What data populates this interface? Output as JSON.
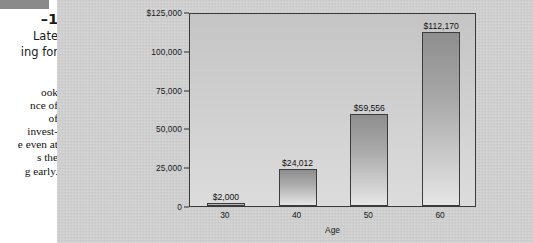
{
  "caption": {
    "rule": "",
    "figure_number": "–1",
    "heading_lines": [
      " Late",
      "ing for"
    ],
    "body_lines": [
      "ook",
      "nce of",
      " of",
      "invest-",
      "e even at",
      "s the",
      "g early."
    ]
  },
  "colors": {
    "panel_background": "#d3d3d3",
    "plot_background": "#cfcfcf",
    "bar_top": "#8e8e8e",
    "bar_bottom": "#e6e6e6",
    "bar_border": "#3c3c3c",
    "axis": "#2e2e2e",
    "text": "#111111",
    "rule": "#8a8a8a"
  },
  "chart_data": {
    "type": "bar",
    "title": "",
    "xlabel": "Age",
    "ylabel": "",
    "categories": [
      "30",
      "40",
      "50",
      "60"
    ],
    "values": [
      2000,
      24012,
      59556,
      112170
    ],
    "value_labels": [
      "$2,000",
      "$24,012",
      "$59,556",
      "$112,170"
    ],
    "ylim": [
      0,
      125000
    ],
    "ytick_values": [
      125000,
      100000,
      75000,
      50000,
      25000,
      0
    ],
    "ytick_labels": [
      "$125,000",
      "100,000",
      "75,000",
      "50,000",
      "25,000",
      "0"
    ],
    "grid": false,
    "legend": "none"
  }
}
